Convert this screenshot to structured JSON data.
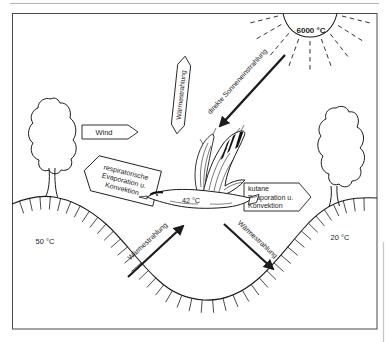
{
  "scene": {
    "sun": {
      "temperature_label": "6000 °C"
    },
    "wind_label": "Wind",
    "arrows": {
      "direct_solar_label": "direkte Sonneneinstrahlung",
      "radiation_up_label": "Wärmestrahlung",
      "radiation_ground_to_bird_label": "Wärmestrahlung",
      "radiation_bird_to_ground_label": "Wärmestrahlung"
    },
    "respiratory_box": {
      "line1": "respiratorische",
      "line2": "Evaporation u.",
      "line3": "Konvektion"
    },
    "cutaneous_box": {
      "line1": "kutane",
      "line2": "Evaporation u.",
      "line3": "Konvektion"
    },
    "temperatures": {
      "ground_left": "50 °C",
      "ground_right": "20 °C",
      "bird_body": "42 °C"
    },
    "colors": {
      "ink": "#1c1c1c",
      "paper": "#ffffff"
    }
  }
}
